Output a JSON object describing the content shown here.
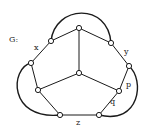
{
  "diagram": {
    "graph_label": "G:",
    "edge_labels": {
      "x": "x",
      "y": "y",
      "p": "p",
      "q": "q",
      "z": "z"
    },
    "colors": {
      "stroke": "#1a1a1a",
      "vertex_fill": "#ffffff",
      "background": "#ffffff"
    }
  }
}
